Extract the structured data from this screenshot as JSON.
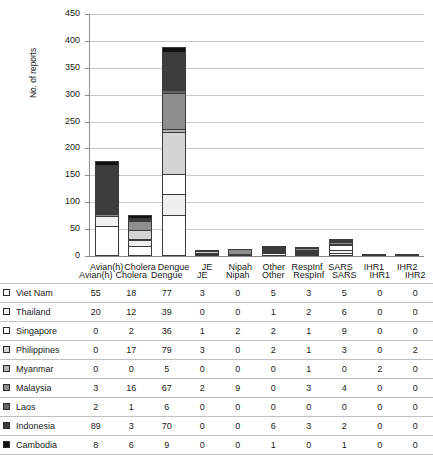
{
  "chart_data": {
    "type": "bar",
    "subtype": "stacked-bar",
    "title": "",
    "xlabel": "",
    "ylabel": "No. of reports",
    "ylim": [
      0,
      450
    ],
    "yticks": [
      0,
      50,
      100,
      150,
      200,
      250,
      300,
      350,
      400,
      450
    ],
    "grid": true,
    "legend_position": "table-left-column",
    "categories": [
      "Avian(h)",
      "Cholera",
      "Dengue",
      "JE",
      "Nipah",
      "Other",
      "RespInf",
      "SARS",
      "IHR1",
      "IHR2"
    ],
    "series": [
      {
        "name": "Viet Nam",
        "color": "#ffffff",
        "values": [
          55,
          18,
          77,
          3,
          0,
          5,
          3,
          5,
          0,
          0
        ]
      },
      {
        "name": "Thailand",
        "color": "#f0f0f0",
        "values": [
          20,
          12,
          39,
          0,
          0,
          1,
          2,
          6,
          0,
          0
        ]
      },
      {
        "name": "Singapore",
        "color": "#ffffff",
        "values": [
          0,
          2,
          36,
          1,
          2,
          2,
          1,
          9,
          0,
          0
        ]
      },
      {
        "name": "Philippines",
        "color": "#d4d4d4",
        "values": [
          0,
          17,
          79,
          3,
          0,
          2,
          1,
          3,
          0,
          2
        ]
      },
      {
        "name": "Myanmar",
        "color": "#b3b3b3",
        "values": [
          0,
          0,
          5,
          0,
          0,
          0,
          1,
          0,
          2,
          0
        ]
      },
      {
        "name": "Malaysia",
        "color": "#8e8e8e",
        "values": [
          3,
          16,
          67,
          2,
          9,
          0,
          3,
          4,
          0,
          0
        ]
      },
      {
        "name": "Laos",
        "color": "#666666",
        "values": [
          2,
          1,
          6,
          0,
          0,
          0,
          0,
          0,
          0,
          0
        ]
      },
      {
        "name": "Indonesia",
        "color": "#3d3d3d",
        "values": [
          89,
          3,
          70,
          0,
          0,
          6,
          3,
          2,
          0,
          0
        ]
      },
      {
        "name": "Cambodia",
        "color": "#111111",
        "values": [
          8,
          6,
          9,
          0,
          0,
          1,
          0,
          1,
          0,
          0
        ]
      }
    ],
    "totals": [
      177,
      75,
      388,
      9,
      11,
      17,
      14,
      30,
      2,
      2
    ]
  },
  "table": {
    "columns": [
      "",
      "Avian(h)",
      "Cholera",
      "Dengue",
      "JE",
      "Nipah",
      "Other",
      "RespInf",
      "SARS",
      "IHR1",
      "IHR2"
    ],
    "rows": [
      {
        "country": "Viet Nam",
        "swatch": "#ffffff",
        "values": [
          55,
          18,
          77,
          3,
          0,
          5,
          3,
          5,
          0,
          0
        ]
      },
      {
        "country": "Thailand",
        "swatch": "#f0f0f0",
        "values": [
          20,
          12,
          39,
          0,
          0,
          1,
          2,
          6,
          0,
          0
        ]
      },
      {
        "country": "Singapore",
        "swatch": "#ffffff",
        "values": [
          0,
          2,
          36,
          1,
          2,
          2,
          1,
          9,
          0,
          0
        ]
      },
      {
        "country": "Philippines",
        "swatch": "#d4d4d4",
        "values": [
          0,
          17,
          79,
          3,
          0,
          2,
          1,
          3,
          0,
          2
        ]
      },
      {
        "country": "Myanmar",
        "swatch": "#b3b3b3",
        "values": [
          0,
          0,
          5,
          0,
          0,
          0,
          1,
          0,
          2,
          0
        ]
      },
      {
        "country": "Malaysia",
        "swatch": "#8e8e8e",
        "values": [
          3,
          16,
          67,
          2,
          9,
          0,
          3,
          4,
          0,
          0
        ]
      },
      {
        "country": "Laos",
        "swatch": "#666666",
        "values": [
          2,
          1,
          6,
          0,
          0,
          0,
          0,
          0,
          0,
          0
        ]
      },
      {
        "country": "Indonesia",
        "swatch": "#3d3d3d",
        "values": [
          89,
          3,
          70,
          0,
          0,
          6,
          3,
          2,
          0,
          0
        ]
      },
      {
        "country": "Cambodia",
        "swatch": "#111111",
        "values": [
          8,
          6,
          9,
          0,
          0,
          1,
          0,
          1,
          0,
          0
        ]
      }
    ]
  }
}
